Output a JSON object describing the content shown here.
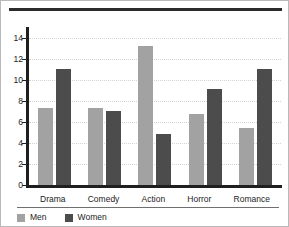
{
  "chart_data": {
    "type": "bar",
    "title": "",
    "subtitle": "",
    "xlabel": "",
    "ylabel": "",
    "categories": [
      "Drama",
      "Comedy",
      "Action",
      "Horror",
      "Romance"
    ],
    "series": [
      {
        "name": "Men",
        "color": "#a2a2a2",
        "values": [
          7.3,
          7.3,
          13.2,
          6.7,
          5.4
        ]
      },
      {
        "name": "Women",
        "color": "#4c4c4c",
        "values": [
          11.0,
          7.05,
          4.8,
          9.1,
          11.05
        ]
      }
    ],
    "ylim": [
      0,
      15
    ],
    "yticks": [
      0,
      2,
      4,
      6,
      8,
      10,
      12,
      14
    ],
    "ytick_labels": [
      "0",
      "2",
      "4",
      "6",
      "8",
      "10",
      "12",
      "14"
    ],
    "grid": true,
    "grid_style": "dotted",
    "grid_axis": "y",
    "legend_position": "bottom-left",
    "annotations": []
  },
  "legend": {
    "items": [
      {
        "label": "Men",
        "swatch": "men-swatch"
      },
      {
        "label": "Women",
        "swatch": "women-swatch"
      }
    ]
  }
}
